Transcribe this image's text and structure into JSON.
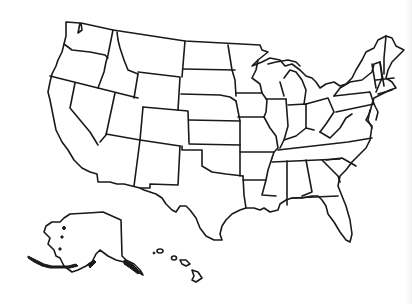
{
  "map": {
    "title": "",
    "type": "blank-outline-map",
    "region": "United States",
    "background_color": "#ffffff",
    "stroke_color": "#1a1a1a",
    "fill_color": "#ffffff",
    "labels_visible": false,
    "insets": [
      "alaska",
      "hawaii"
    ]
  }
}
